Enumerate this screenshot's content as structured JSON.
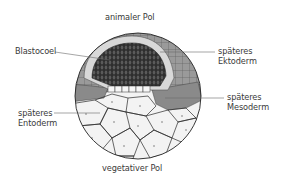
{
  "diagram": {
    "type": "blastula cross-section",
    "labels": {
      "top_pole": "animaler Pol",
      "bottom_pole": "vegetativer Pol",
      "blastocoel": "Blastocoel",
      "ectoderm": {
        "line1": "späteres",
        "line2": "Ektoderm"
      },
      "mesoderm": {
        "line1": "späteres",
        "line2": "Mesoderm"
      },
      "entoderm": {
        "line1": "späteres",
        "line2": "Entoderm"
      }
    },
    "colors": {
      "background": "#ffffff",
      "outline": "#2a2a2a",
      "ectoderm_outer": "#8c8c8c",
      "ectoderm_inner_ring": "#d9d9d9",
      "blastocoel_fill": "#3a3a3a",
      "mesoderm": "#8f8f8f",
      "entoderm": "#f4f4f4",
      "label_text": "#3a3a3a",
      "leader_line": "#6a6a6a"
    }
  }
}
